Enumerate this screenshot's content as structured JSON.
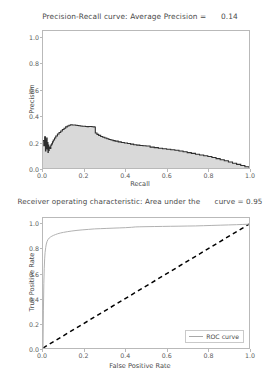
{
  "figure": {
    "background": "#ffffff",
    "width": 280,
    "height": 374
  },
  "panels": {
    "precision_recall": {
      "title": "Precision-Recall curve: Average Precision =      0.14",
      "xlabel": "Recall",
      "ylabel": "Precision",
      "xticks": [
        "0.0",
        "0.2",
        "0.4",
        "0.6",
        "0.8",
        "1.0"
      ],
      "yticks": [
        "0.0",
        "0.2",
        "0.4",
        "0.6",
        "0.8",
        "1.0"
      ]
    },
    "roc": {
      "title": "Receiver operating characteristic: Area under the      curve = 0.95",
      "xlabel": "False Positive Rate",
      "ylabel": "True Positive Rate",
      "xticks": [
        "0.0",
        "0.2",
        "0.4",
        "0.6",
        "0.8",
        "1.0"
      ],
      "yticks": [
        "0.0",
        "0.2",
        "0.4",
        "0.6",
        "0.8",
        "1.0"
      ],
      "legend": {
        "label": "ROC curve",
        "position": "lower right"
      }
    }
  },
  "chart_data": [
    {
      "type": "area",
      "title": "Precision-Recall curve: Average Precision =      0.14",
      "xlabel": "Recall",
      "ylabel": "Precision",
      "xlim": [
        0.0,
        1.0
      ],
      "ylim": [
        0.0,
        1.05
      ],
      "grid": false,
      "legend": null,
      "annotations": [
        {
          "text": "Average Precision = 0.14",
          "value": 0.14
        }
      ],
      "style": {
        "line_color": "#2f2f2f",
        "fill_color": "#d9d9d9",
        "drawstyle": "steps-post"
      },
      "series": [
        {
          "name": "Precision-Recall",
          "x": [
            0.0,
            0.004,
            0.008,
            0.012,
            0.014,
            0.016,
            0.018,
            0.02,
            0.022,
            0.024,
            0.026,
            0.028,
            0.03,
            0.034,
            0.038,
            0.042,
            0.046,
            0.05,
            0.056,
            0.062,
            0.07,
            0.078,
            0.086,
            0.094,
            0.102,
            0.11,
            0.118,
            0.126,
            0.134,
            0.142,
            0.15,
            0.158,
            0.166,
            0.174,
            0.182,
            0.19,
            0.198,
            0.206,
            0.214,
            0.222,
            0.23,
            0.238,
            0.246,
            0.25,
            0.254,
            0.262,
            0.27,
            0.28,
            0.29,
            0.3,
            0.31,
            0.32,
            0.33,
            0.34,
            0.35,
            0.365,
            0.38,
            0.395,
            0.41,
            0.425,
            0.44,
            0.455,
            0.47,
            0.485,
            0.5,
            0.52,
            0.54,
            0.56,
            0.58,
            0.6,
            0.62,
            0.64,
            0.66,
            0.68,
            0.7,
            0.72,
            0.74,
            0.76,
            0.78,
            0.8,
            0.82,
            0.84,
            0.86,
            0.88,
            0.9,
            0.92,
            0.94,
            0.96,
            0.98,
            1.0
          ],
          "y": [
            0.21,
            0.17,
            0.24,
            0.13,
            0.215,
            0.15,
            0.23,
            0.145,
            0.195,
            0.12,
            0.175,
            0.135,
            0.16,
            0.15,
            0.175,
            0.185,
            0.2,
            0.215,
            0.23,
            0.245,
            0.26,
            0.272,
            0.283,
            0.295,
            0.305,
            0.315,
            0.322,
            0.328,
            0.331,
            0.33,
            0.33,
            0.327,
            0.326,
            0.324,
            0.322,
            0.32,
            0.32,
            0.318,
            0.317,
            0.318,
            0.318,
            0.316,
            0.315,
            0.314,
            0.268,
            0.258,
            0.25,
            0.242,
            0.236,
            0.23,
            0.224,
            0.219,
            0.214,
            0.21,
            0.206,
            0.2,
            0.196,
            0.192,
            0.188,
            0.183,
            0.178,
            0.175,
            0.172,
            0.17,
            0.168,
            0.16,
            0.156,
            0.152,
            0.148,
            0.144,
            0.14,
            0.136,
            0.13,
            0.124,
            0.118,
            0.112,
            0.106,
            0.1,
            0.094,
            0.088,
            0.08,
            0.072,
            0.063,
            0.055,
            0.046,
            0.037,
            0.028,
            0.019,
            0.01,
            0.002
          ]
        }
      ]
    },
    {
      "type": "line",
      "title": "Receiver operating characteristic: Area under the      curve = 0.95",
      "xlabel": "False Positive Rate",
      "ylabel": "True Positive Rate",
      "xlim": [
        0.0,
        1.0
      ],
      "ylim": [
        0.0,
        1.05
      ],
      "grid": false,
      "legend": {
        "entries": [
          "ROC curve"
        ],
        "position": "lower right"
      },
      "annotations": [
        {
          "text": "Area under the curve = 0.95",
          "value": 0.95
        }
      ],
      "style": {
        "roc_color": "#b0b0b0",
        "chance_color": "#000000",
        "chance_dash": "dashed"
      },
      "series": [
        {
          "name": "ROC curve",
          "x": [
            0.0,
            0.002,
            0.004,
            0.006,
            0.008,
            0.01,
            0.013,
            0.016,
            0.02,
            0.025,
            0.03,
            0.036,
            0.043,
            0.05,
            0.06,
            0.07,
            0.085,
            0.1,
            0.12,
            0.14,
            0.165,
            0.19,
            0.22,
            0.25,
            0.28,
            0.31,
            0.34,
            0.37,
            0.4,
            0.43,
            0.45,
            0.47,
            0.5,
            0.54,
            0.58,
            0.62,
            0.66,
            0.7,
            0.74,
            0.78,
            0.82,
            0.86,
            0.9,
            0.94,
            0.97,
            1.0
          ],
          "y": [
            0.0,
            0.3,
            0.52,
            0.64,
            0.72,
            0.77,
            0.81,
            0.84,
            0.862,
            0.878,
            0.888,
            0.896,
            0.903,
            0.909,
            0.916,
            0.922,
            0.929,
            0.934,
            0.94,
            0.945,
            0.95,
            0.954,
            0.958,
            0.962,
            0.964,
            0.966,
            0.968,
            0.97,
            0.972,
            0.975,
            0.978,
            0.979,
            0.98,
            0.981,
            0.982,
            0.983,
            0.984,
            0.985,
            0.986,
            0.988,
            0.99,
            0.992,
            0.994,
            0.996,
            0.998,
            1.0
          ]
        },
        {
          "name": "chance",
          "x": [
            0.0,
            1.0
          ],
          "y": [
            0.0,
            1.0
          ]
        }
      ]
    }
  ]
}
